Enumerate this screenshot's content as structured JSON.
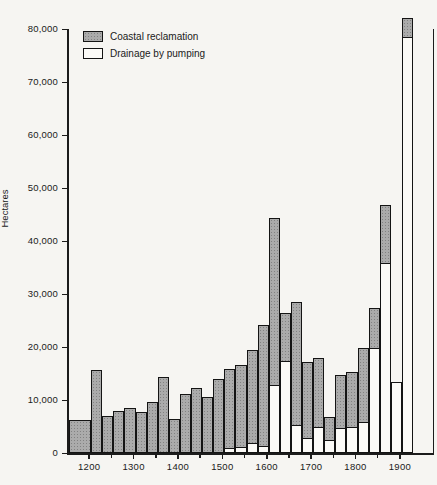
{
  "chart_data": {
    "type": "bar",
    "subtype": "stacked-histogram",
    "title": "",
    "xlabel": "",
    "ylabel": "Hectares",
    "unit": "hectares",
    "grid": false,
    "legend_position": "top-left-inside",
    "ylim": [
      0,
      80000
    ],
    "x_domain": [
      1150,
      1970
    ],
    "y_ticks": [
      {
        "value": 0,
        "label": "0"
      },
      {
        "value": 10000,
        "label": "10,000"
      },
      {
        "value": 20000,
        "label": "20,000"
      },
      {
        "value": 30000,
        "label": "30,000"
      },
      {
        "value": 40000,
        "label": "40,000"
      },
      {
        "value": 50000,
        "label": "50,000"
      },
      {
        "value": 60000,
        "label": "60,000"
      },
      {
        "value": 70000,
        "label": "70,000"
      },
      {
        "value": 80000,
        "label": "80,000"
      }
    ],
    "x_major_ticks": [
      {
        "value": 1200,
        "label": "1200"
      },
      {
        "value": 1300,
        "label": "1300"
      },
      {
        "value": 1400,
        "label": "1400"
      },
      {
        "value": 1500,
        "label": "1500"
      },
      {
        "value": 1600,
        "label": "1600"
      },
      {
        "value": 1700,
        "label": "1700"
      },
      {
        "value": 1800,
        "label": "1800"
      },
      {
        "value": 1900,
        "label": "1900"
      }
    ],
    "x_minor_ticks": [
      1250,
      1350,
      1450,
      1550,
      1650,
      1750,
      1850
    ],
    "legend": [
      {
        "label": "Coastal reclamation",
        "fill": "gray-stipple",
        "color": "#ababab"
      },
      {
        "label": "Drainage by pumping",
        "fill": "white",
        "color": "#fbfaf7"
      }
    ],
    "bins": [
      {
        "start": 1150,
        "end": 1200,
        "coastal_reclamation": 6300,
        "drainage_by_pumping": 0
      },
      {
        "start": 1200,
        "end": 1225,
        "coastal_reclamation": 15600,
        "drainage_by_pumping": 0
      },
      {
        "start": 1225,
        "end": 1250,
        "coastal_reclamation": 7000,
        "drainage_by_pumping": 0
      },
      {
        "start": 1250,
        "end": 1275,
        "coastal_reclamation": 7900,
        "drainage_by_pumping": 0
      },
      {
        "start": 1275,
        "end": 1300,
        "coastal_reclamation": 8400,
        "drainage_by_pumping": 0
      },
      {
        "start": 1300,
        "end": 1325,
        "coastal_reclamation": 7800,
        "drainage_by_pumping": 0
      },
      {
        "start": 1325,
        "end": 1350,
        "coastal_reclamation": 9600,
        "drainage_by_pumping": 0
      },
      {
        "start": 1350,
        "end": 1375,
        "coastal_reclamation": 14300,
        "drainage_by_pumping": 0
      },
      {
        "start": 1375,
        "end": 1400,
        "coastal_reclamation": 6500,
        "drainage_by_pumping": 0
      },
      {
        "start": 1400,
        "end": 1425,
        "coastal_reclamation": 11200,
        "drainage_by_pumping": 0
      },
      {
        "start": 1425,
        "end": 1450,
        "coastal_reclamation": 12300,
        "drainage_by_pumping": 0
      },
      {
        "start": 1450,
        "end": 1475,
        "coastal_reclamation": 10500,
        "drainage_by_pumping": 0
      },
      {
        "start": 1475,
        "end": 1500,
        "coastal_reclamation": 13900,
        "drainage_by_pumping": 0
      },
      {
        "start": 1500,
        "end": 1525,
        "coastal_reclamation": 14900,
        "drainage_by_pumping": 1000
      },
      {
        "start": 1525,
        "end": 1550,
        "coastal_reclamation": 15400,
        "drainage_by_pumping": 1200
      },
      {
        "start": 1550,
        "end": 1575,
        "coastal_reclamation": 17400,
        "drainage_by_pumping": 2000
      },
      {
        "start": 1575,
        "end": 1600,
        "coastal_reclamation": 22700,
        "drainage_by_pumping": 1500
      },
      {
        "start": 1600,
        "end": 1625,
        "coastal_reclamation": 31300,
        "drainage_by_pumping": 13000
      },
      {
        "start": 1625,
        "end": 1650,
        "coastal_reclamation": 9000,
        "drainage_by_pumping": 17500
      },
      {
        "start": 1650,
        "end": 1675,
        "coastal_reclamation": 23200,
        "drainage_by_pumping": 5300
      },
      {
        "start": 1675,
        "end": 1700,
        "coastal_reclamation": 14200,
        "drainage_by_pumping": 3000
      },
      {
        "start": 1700,
        "end": 1725,
        "coastal_reclamation": 12900,
        "drainage_by_pumping": 5000
      },
      {
        "start": 1725,
        "end": 1750,
        "coastal_reclamation": 4300,
        "drainage_by_pumping": 2500
      },
      {
        "start": 1750,
        "end": 1775,
        "coastal_reclamation": 10000,
        "drainage_by_pumping": 4800
      },
      {
        "start": 1775,
        "end": 1800,
        "coastal_reclamation": 10300,
        "drainage_by_pumping": 5000
      },
      {
        "start": 1800,
        "end": 1825,
        "coastal_reclamation": 13800,
        "drainage_by_pumping": 6000
      },
      {
        "start": 1825,
        "end": 1850,
        "coastal_reclamation": 7400,
        "drainage_by_pumping": 20000
      },
      {
        "start": 1850,
        "end": 1875,
        "coastal_reclamation": 10800,
        "drainage_by_pumping": 36000
      },
      {
        "start": 1875,
        "end": 1900,
        "coastal_reclamation": 0,
        "drainage_by_pumping": 13400
      },
      {
        "start": 1900,
        "end": 1925,
        "coastal_reclamation": 3500,
        "drainage_by_pumping": 78500
      }
    ]
  }
}
